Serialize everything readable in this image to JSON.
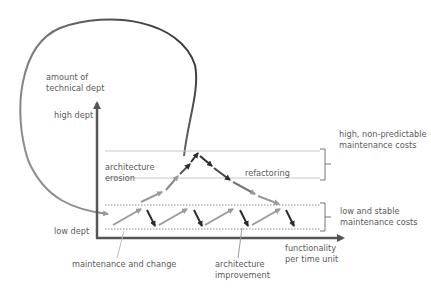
{
  "labels": {
    "y_axis_title_line1": "amount of",
    "y_axis_title_line2": "technical dept",
    "high_dept": "high dept",
    "low_dept": "low dept",
    "architecture_erosion_line1": "architecture",
    "architecture_erosion_line2": "erosion",
    "refactoring": "refactoring",
    "high_costs_line1": "high, non-predictable",
    "high_costs_line2": "maintenance costs",
    "low_costs_line1": "low and stable",
    "low_costs_line2": "maintenance costs",
    "x_axis_title_line1": "functionality",
    "x_axis_title_line2": "per time unit",
    "maintenance_and_change": "maintenance and change",
    "architecture_improvement_line1": "architecture",
    "architecture_improvement_line2": "improvement"
  },
  "colors": {
    "gray_arrow": "#9a9a9a",
    "dark_arrow": "#2b2b2b",
    "axis": "#555555",
    "dotted_line": "#8a8a8a",
    "band_line": "#c8c8c8"
  }
}
